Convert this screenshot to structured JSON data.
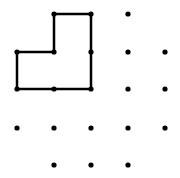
{
  "diagram": {
    "type": "dot-grid-geoboard",
    "background": "#ffffff",
    "ink_color": "#000000",
    "grid": {
      "columns_x": [
        17,
        54,
        91,
        128,
        165
      ],
      "rows_y": [
        14,
        52,
        89,
        128,
        165
      ]
    },
    "dots": [
      [
        1,
        0
      ],
      [
        2,
        0
      ],
      [
        3,
        0
      ],
      [
        0,
        1
      ],
      [
        1,
        1
      ],
      [
        2,
        1
      ],
      [
        3,
        1
      ],
      [
        4,
        1
      ],
      [
        0,
        2
      ],
      [
        1,
        2
      ],
      [
        2,
        2
      ],
      [
        3,
        2
      ],
      [
        4,
        2
      ],
      [
        0,
        3
      ],
      [
        1,
        3
      ],
      [
        2,
        3
      ],
      [
        3,
        3
      ],
      [
        4,
        3
      ],
      [
        1,
        4
      ],
      [
        2,
        4
      ],
      [
        3,
        4
      ]
    ],
    "shape": {
      "name": "L-shaped polygon",
      "vertices": [
        [
          1,
          0
        ],
        [
          2,
          0
        ],
        [
          2,
          2
        ],
        [
          0,
          2
        ],
        [
          0,
          1
        ],
        [
          1,
          1
        ]
      ],
      "stroke_width": 2.5
    },
    "dot_radius": 2.6
  }
}
